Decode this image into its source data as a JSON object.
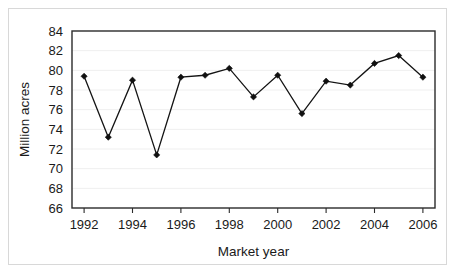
{
  "chart_data": {
    "type": "line",
    "title": "",
    "subtitle": "",
    "xlabel": "Market year",
    "ylabel": "Million acres",
    "x": [
      1992,
      1993,
      1994,
      1995,
      1996,
      1997,
      1998,
      1999,
      2000,
      2001,
      2002,
      2003,
      2004,
      2005,
      2006
    ],
    "values": [
      79.4,
      73.2,
      79.0,
      71.4,
      79.3,
      79.5,
      80.2,
      77.3,
      79.5,
      75.6,
      78.9,
      78.5,
      80.7,
      81.5,
      79.3
    ],
    "series": [
      {
        "name": "Planted acreage",
        "values": [
          79.4,
          73.2,
          79.0,
          71.4,
          79.3,
          79.5,
          80.2,
          77.3,
          79.5,
          75.6,
          78.9,
          78.5,
          80.7,
          81.5,
          79.3
        ]
      }
    ],
    "xlim": [
      1991.5,
      2006.5
    ],
    "ylim": [
      66,
      84
    ],
    "ytick_labels": [
      "84",
      "82",
      "80",
      "78",
      "76",
      "74",
      "72",
      "70",
      "68",
      "66"
    ],
    "ytick_values": [
      84,
      82,
      80,
      78,
      76,
      74,
      72,
      70,
      68,
      66
    ],
    "xtick_labels": [
      "1992",
      "1994",
      "1996",
      "1998",
      "2000",
      "2002",
      "2004",
      "2006"
    ],
    "xtick_values": [
      1992,
      1994,
      1996,
      1998,
      2000,
      2002,
      2004,
      2006
    ],
    "grid": "horizontal",
    "legend": "none",
    "marker": "diamond",
    "line_color": "#141414",
    "marker_color": "#101010",
    "grid_color": "#efefef",
    "axis_color": "#2b2b2b",
    "background_color": "#ffffff"
  }
}
